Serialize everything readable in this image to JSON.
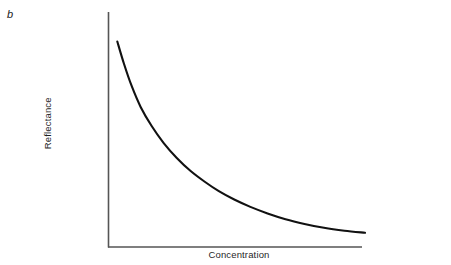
{
  "figure": {
    "panel_label": "b",
    "background_color": "#ffffff"
  },
  "chart_data": {
    "type": "line",
    "title": "",
    "subtitle": "",
    "panel_label": "b",
    "xlabel": "Concentration",
    "ylabel": "Reflectance",
    "xlim": [
      0,
      1
    ],
    "ylim": [
      0,
      1
    ],
    "grid": false,
    "legend": false,
    "legend_position": "none",
    "x_tick_labels": [],
    "y_tick_labels": [],
    "axis_color": "#555555",
    "curve_color": "#111111",
    "curve_width_px": 2.1,
    "annotations": [],
    "series": [
      {
        "name": "Reflectance vs Concentration",
        "color": "#111111",
        "x": [
          0.034,
          0.06,
          0.09,
          0.125,
          0.168,
          0.215,
          0.266,
          0.32,
          0.375,
          0.43,
          0.49,
          0.553,
          0.62,
          0.69,
          0.764,
          0.84,
          0.92,
          1.0
        ],
        "y": [
          0.875,
          0.79,
          0.705,
          0.625,
          0.552,
          0.487,
          0.43,
          0.38,
          0.339,
          0.303,
          0.271,
          0.243,
          0.218,
          0.196,
          0.178,
          0.163,
          0.152,
          0.144
        ]
      }
    ]
  },
  "axes": {
    "x_axis_name": "concentration-axis",
    "y_axis_name": "reflectance-axis"
  }
}
